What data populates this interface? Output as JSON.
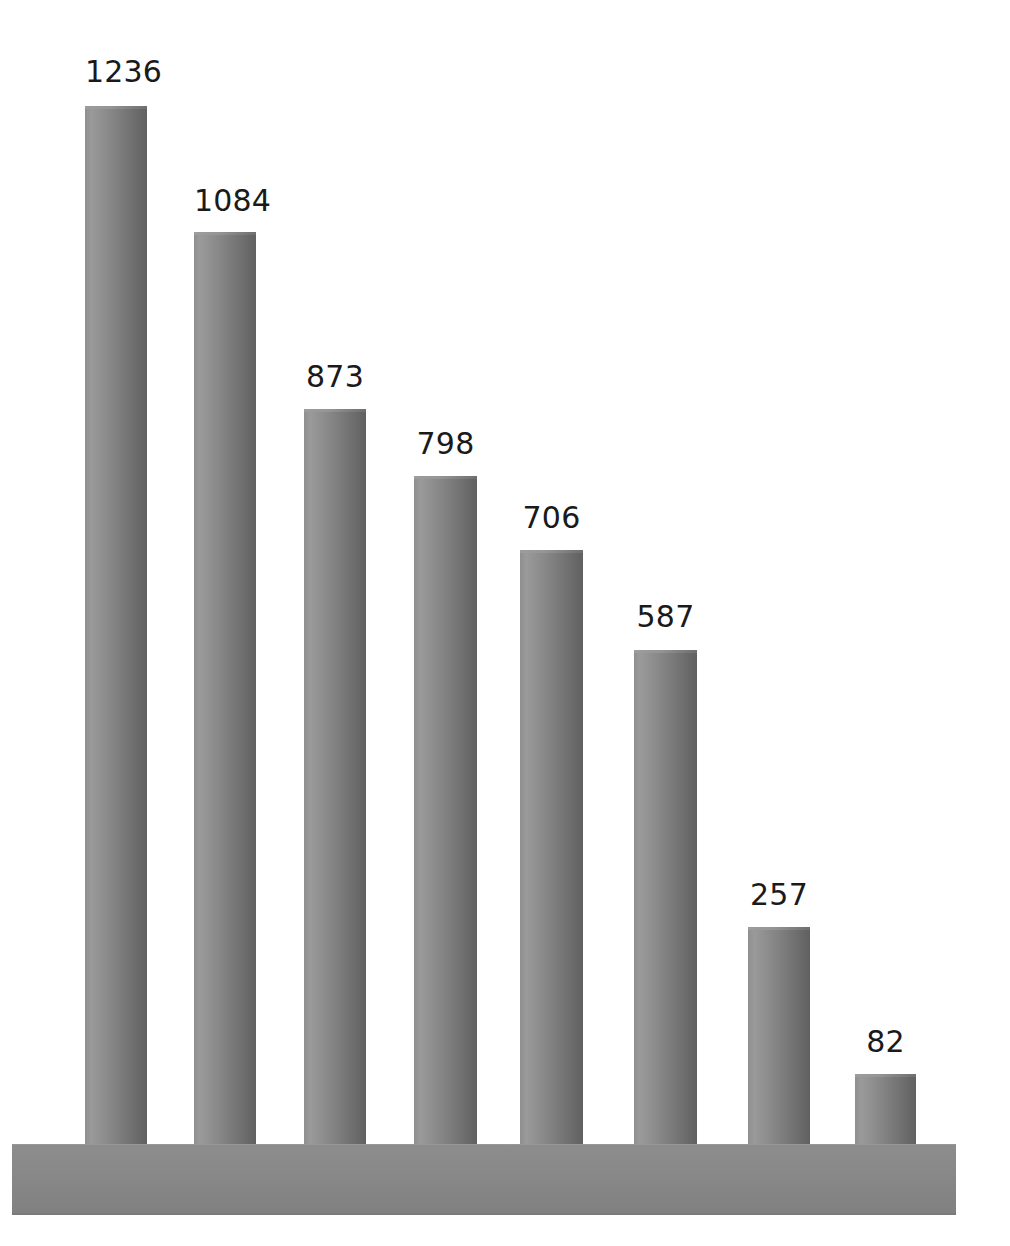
{
  "chart_data": {
    "type": "bar",
    "title": "",
    "subtitle": "",
    "xlabel": "",
    "ylabel": "",
    "categories": [
      "",
      "",
      "",
      "",
      "",
      "",
      "",
      ""
    ],
    "values": [
      1236,
      1084,
      873,
      798,
      706,
      587,
      257,
      82
    ],
    "labels": [
      "1236",
      "1084",
      "873",
      "798",
      "706",
      "587",
      "257",
      "82"
    ],
    "ylim": [
      0,
      1236
    ],
    "grid": false,
    "legend": null,
    "orientation": "vertical",
    "style": "3d-cylindrical-grayscale",
    "tick_labels": {
      "x": [],
      "y": []
    },
    "annotations": [],
    "colors": {
      "bar_light": "#9a9a9a",
      "bar_mid": "#818181",
      "bar_dark": "#616161",
      "base": "#888888",
      "background": "#ffffff",
      "label_text": "#1a1a1a"
    }
  },
  "bars": [
    {
      "label": "1236",
      "value": 1236,
      "left": 85,
      "width": 62,
      "top": 106,
      "label_left": 85,
      "label_top": 57
    },
    {
      "label": "1084",
      "value": 1084,
      "left": 194,
      "width": 62,
      "top": 232,
      "label_left": 194,
      "label_top": 186
    },
    {
      "label": "873",
      "value": 873,
      "left": 304,
      "width": 62,
      "top": 409,
      "label_left": 304,
      "label_top": 362
    },
    {
      "label": "798",
      "value": 798,
      "left": 414,
      "width": 63,
      "top": 476,
      "label_left": 414,
      "label_top": 429
    },
    {
      "label": "706",
      "value": 706,
      "left": 520,
      "width": 63,
      "top": 550,
      "label_left": 520,
      "label_top": 503
    },
    {
      "label": "587",
      "value": 587,
      "left": 634,
      "width": 63,
      "top": 650,
      "label_left": 634,
      "label_top": 602
    },
    {
      "label": "257",
      "value": 257,
      "left": 748,
      "width": 62,
      "top": 927,
      "label_left": 748,
      "label_top": 880
    },
    {
      "label": "82",
      "value": 82,
      "left": 855,
      "width": 61,
      "top": 1074,
      "label_left": 855,
      "label_top": 1027
    }
  ],
  "base": {
    "name": "platform-base",
    "left": 12,
    "top": 1144,
    "width": 944,
    "height": 71
  }
}
